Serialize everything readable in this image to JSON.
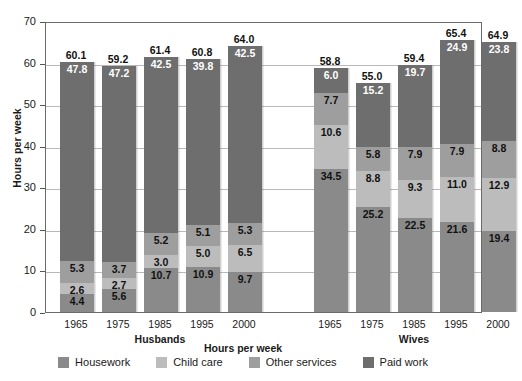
{
  "chart_data": {
    "type": "bar",
    "subtype": "stacked",
    "title": "",
    "xlabel": "Hours per week",
    "ylabel": "Hours per week",
    "ylim": [
      0,
      70
    ],
    "ytick_step": 10,
    "yticks": [
      "70",
      "60",
      "50",
      "40",
      "30",
      "20",
      "10",
      "0"
    ],
    "grid": true,
    "legend_position": "bottom",
    "categories": [
      "1965",
      "1975",
      "1985",
      "1995",
      "2000"
    ],
    "groups": [
      {
        "name": "Husbands",
        "bars": [
          {
            "category": "1965",
            "total": "60.1",
            "segments": [
              {
                "series": "Housework",
                "value": "4.4"
              },
              {
                "series": "Child care",
                "value": "2.6"
              },
              {
                "series": "Other services",
                "value": "5.3"
              },
              {
                "series": "Paid work",
                "value": "47.8"
              }
            ]
          },
          {
            "category": "1975",
            "total": "59.2",
            "segments": [
              {
                "series": "Housework",
                "value": "5.6"
              },
              {
                "series": "Child care",
                "value": "2.7"
              },
              {
                "series": "Other services",
                "value": "3.7"
              },
              {
                "series": "Paid work",
                "value": "47.2"
              }
            ]
          },
          {
            "category": "1985",
            "total": "61.4",
            "segments": [
              {
                "series": "Housework",
                "value": "10.7"
              },
              {
                "series": "Child care",
                "value": "3.0"
              },
              {
                "series": "Other services",
                "value": "5.2"
              },
              {
                "series": "Paid work",
                "value": "42.5"
              }
            ]
          },
          {
            "category": "1995",
            "total": "60.8",
            "segments": [
              {
                "series": "Housework",
                "value": "10.9"
              },
              {
                "series": "Child care",
                "value": "5.0"
              },
              {
                "series": "Other services",
                "value": "5.1"
              },
              {
                "series": "Paid work",
                "value": "39.8"
              }
            ]
          },
          {
            "category": "2000",
            "total": "64.0",
            "segments": [
              {
                "series": "Housework",
                "value": "9.7"
              },
              {
                "series": "Child care",
                "value": "6.5"
              },
              {
                "series": "Other services",
                "value": "5.3"
              },
              {
                "series": "Paid work",
                "value": "42.5"
              }
            ]
          }
        ]
      },
      {
        "name": "Wives",
        "bars": [
          {
            "category": "1965",
            "total": "58.8",
            "segments": [
              {
                "series": "Housework",
                "value": "34.5"
              },
              {
                "series": "Child care",
                "value": "10.6"
              },
              {
                "series": "Other services",
                "value": "7.7"
              },
              {
                "series": "Paid work",
                "value": "6.0"
              }
            ]
          },
          {
            "category": "1975",
            "total": "55.0",
            "segments": [
              {
                "series": "Housework",
                "value": "25.2"
              },
              {
                "series": "Child care",
                "value": "8.8"
              },
              {
                "series": "Other services",
                "value": "5.8"
              },
              {
                "series": "Paid work",
                "value": "15.2"
              }
            ]
          },
          {
            "category": "1985",
            "total": "59.4",
            "segments": [
              {
                "series": "Housework",
                "value": "22.5"
              },
              {
                "series": "Child care",
                "value": "9.3"
              },
              {
                "series": "Other services",
                "value": "7.9"
              },
              {
                "series": "Paid work",
                "value": "19.7"
              }
            ]
          },
          {
            "category": "1995",
            "total": "65.4",
            "segments": [
              {
                "series": "Housework",
                "value": "21.6"
              },
              {
                "series": "Child care",
                "value": "11.0"
              },
              {
                "series": "Other services",
                "value": "7.9"
              },
              {
                "series": "Paid work",
                "value": "24.9"
              }
            ]
          },
          {
            "category": "2000",
            "total": "64.9",
            "segments": [
              {
                "series": "Housework",
                "value": "19.4"
              },
              {
                "series": "Child care",
                "value": "12.9"
              },
              {
                "series": "Other services",
                "value": "8.8"
              },
              {
                "series": "Paid work",
                "value": "23.8"
              }
            ]
          }
        ]
      }
    ],
    "legend": [
      {
        "label": "Housework",
        "color": "#8a8a8a"
      },
      {
        "label": "Child care",
        "color": "#bcbcbc"
      },
      {
        "label": "Other services",
        "color": "#9e9e9e"
      },
      {
        "label": "Paid work",
        "color": "#6e6e6e"
      }
    ]
  },
  "colors": {
    "background": "#ffffff",
    "axis": "#6b6b6b",
    "gridline": "#b9b9b9",
    "text": "#1a1a1a"
  }
}
